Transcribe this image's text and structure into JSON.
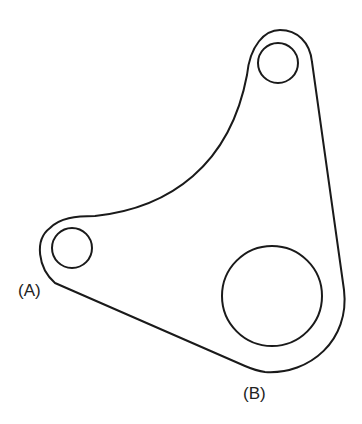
{
  "diagram": {
    "type": "mechanical-link-part",
    "stroke_color": "#1a1a1a",
    "background": "#ffffff",
    "labels": [
      {
        "id": "A",
        "text": "(A)",
        "x": 18,
        "y": 296
      },
      {
        "id": "B",
        "text": "(B)",
        "x": 243,
        "y": 399
      }
    ],
    "holes": [
      {
        "name": "hole-a",
        "cx": 72,
        "cy": 248,
        "r": 20
      },
      {
        "name": "hole-top",
        "cx": 278,
        "cy": 63,
        "r": 20
      },
      {
        "name": "hole-b",
        "cx": 272,
        "cy": 296,
        "r": 50
      }
    ]
  }
}
